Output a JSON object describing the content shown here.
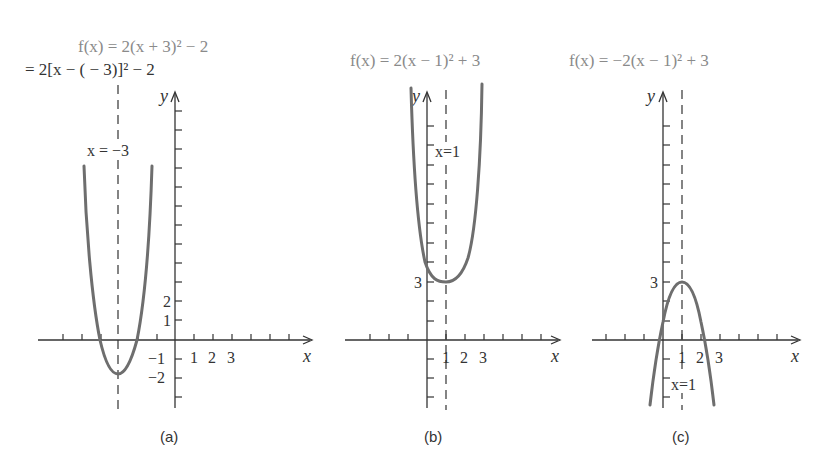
{
  "figure": {
    "panels": [
      {
        "id": "a",
        "caption": "(a)",
        "equation_line1": "f(x) = 2(x + 3)² − 2",
        "equation_line2": "= 2[x − ( − 3)]² − 2",
        "axis_line_label": "x = −3",
        "x_axis_label": "x",
        "y_axis_label": "y",
        "x_tick_labels": [
          "1",
          "2",
          "3"
        ],
        "y_tick_labels": [
          "2",
          "1",
          "−1",
          "−2"
        ],
        "vertex": [
          -3,
          -2
        ],
        "axis_of_symmetry": -3
      },
      {
        "id": "b",
        "caption": "(b)",
        "equation_line1": "f(x) = 2(x − 1)² + 3",
        "axis_line_label": "x=1",
        "x_axis_label": "x",
        "y_axis_label": "y",
        "x_tick_labels": [
          "1",
          "2",
          "3"
        ],
        "y_tick_labels": [
          "3"
        ],
        "vertex": [
          1,
          3
        ],
        "axis_of_symmetry": 1
      },
      {
        "id": "c",
        "caption": "(c)",
        "equation_line1": "f(x) = −2(x − 1)² + 3",
        "axis_line_label": "x=1",
        "x_axis_label": "x",
        "y_axis_label": "y",
        "x_tick_labels": [
          "1",
          "2",
          "3"
        ],
        "y_tick_labels": [
          "3"
        ],
        "vertex": [
          1,
          3
        ],
        "axis_of_symmetry": 1
      }
    ],
    "colors": {
      "curve": "#6e6e6e",
      "axes": "#333333",
      "equation_text": "#8a8a8a"
    }
  }
}
